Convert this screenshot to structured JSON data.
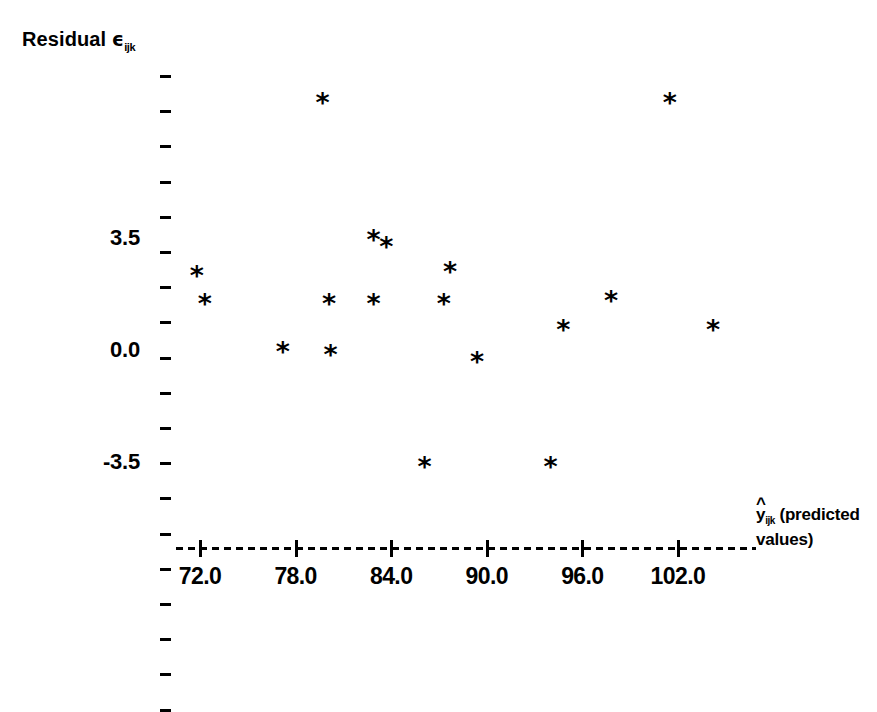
{
  "chart_data": {
    "type": "scatter",
    "title": "",
    "ylabel": "Residual ϵijk",
    "ylabel_main": "Residual",
    "ylabel_symbol": "ϵ",
    "ylabel_subscript": "ijk",
    "xlabel": "ŷijk (predicted values)",
    "xlabel_symbol": "y",
    "xlabel_subscript": "ijk",
    "xlabel_rest": "(predicted",
    "xlabel_rest2": "values)",
    "xlabel_hat": "^",
    "x_ticks": [
      72.0,
      78.0,
      84.0,
      90.0,
      96.0,
      102.0
    ],
    "x_tick_labels": [
      "72.0",
      "78.0",
      "84.0",
      "90.0",
      "96.0",
      "102.0"
    ],
    "y_ticks": [
      3.5,
      0.0,
      -3.5
    ],
    "y_tick_labels": [
      "3.5",
      "0.0",
      "-3.5"
    ],
    "y_minor_tick_count": 19,
    "xlim": [
      69.3,
      106.8
    ],
    "ylim": [
      -5.9,
      8.6
    ],
    "grid": false,
    "legend": null,
    "marker": "*",
    "marker_color": "#000000",
    "axis_style": "dashed-baseline-only",
    "points": [
      {
        "x": 71.8,
        "y": 2.4
      },
      {
        "x": 72.3,
        "y": 1.5
      },
      {
        "x": 77.2,
        "y": 0.0
      },
      {
        "x": 79.7,
        "y": 7.8
      },
      {
        "x": 80.1,
        "y": 1.5
      },
      {
        "x": 80.2,
        "y": -0.1
      },
      {
        "x": 82.9,
        "y": 1.5
      },
      {
        "x": 82.9,
        "y": 3.5
      },
      {
        "x": 83.7,
        "y": 3.3
      },
      {
        "x": 86.1,
        "y": -3.6
      },
      {
        "x": 87.7,
        "y": 2.5
      },
      {
        "x": 87.3,
        "y": 1.5
      },
      {
        "x": 89.4,
        "y": -0.3
      },
      {
        "x": 94.0,
        "y": -3.6
      },
      {
        "x": 94.8,
        "y": 0.7
      },
      {
        "x": 97.8,
        "y": 1.6
      },
      {
        "x": 101.5,
        "y": 7.8
      },
      {
        "x": 104.2,
        "y": 0.7
      }
    ],
    "n_points": 18
  },
  "axis_geometry": {
    "x_pixel_at_72": 200,
    "x_pixels_per_unit": 15.93,
    "y_pixel_at_0": 352,
    "y_pixels_per_unit": 31.86
  }
}
